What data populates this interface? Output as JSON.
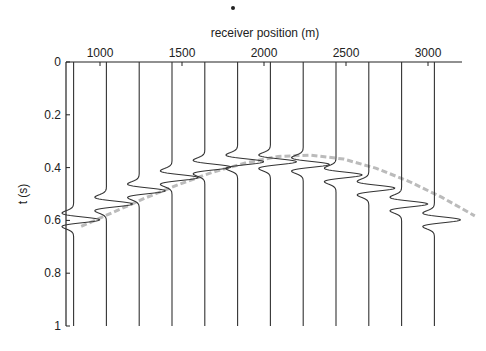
{
  "chart_data": {
    "type": "line",
    "subtype": "seismic-wiggle-traces",
    "title": "",
    "xlabel": "receiver position (m)",
    "ylabel": "t (s)",
    "x_axis_position": "top",
    "xlim": [
      800,
      3200
    ],
    "ylim": [
      0,
      1
    ],
    "y_inverted": true,
    "xticks": [
      1000,
      1500,
      2000,
      2500,
      3000
    ],
    "xtick_labels": [
      "1000",
      "1500",
      "2000",
      "2500",
      "3000"
    ],
    "yticks": [
      0,
      0.2,
      0.4,
      0.6,
      0.8,
      1
    ],
    "ytick_labels": [
      "0",
      "0.2",
      "0.4",
      "0.6",
      "0.8",
      "1"
    ],
    "grid": false,
    "series": [
      {
        "name": "traces",
        "receiver_positions": [
          900,
          1100,
          1300,
          1500,
          1700,
          1900,
          2100,
          2300,
          2500,
          2700,
          2900,
          3100
        ],
        "arrival_times": [
          0.56,
          0.5,
          0.45,
          0.4,
          0.36,
          0.34,
          0.34,
          0.35,
          0.39,
          0.44,
          0.5,
          0.56
        ]
      },
      {
        "name": "traveltime-curve",
        "style": "gray dashed hyperbola overlay",
        "x": [
          800,
          1000,
          1200,
          1400,
          1600,
          1800,
          2000,
          2200,
          2400,
          2600,
          2800,
          3000,
          3200
        ],
        "t": [
          0.6,
          0.545,
          0.49,
          0.44,
          0.395,
          0.36,
          0.335,
          0.33,
          0.345,
          0.38,
          0.43,
          0.49,
          0.56
        ]
      }
    ]
  },
  "labels": {
    "xlabel": "receiver position (m)",
    "ylabel": "t (s)",
    "xticks": [
      "1000",
      "1500",
      "2000",
      "2500",
      "3000"
    ],
    "yticks": [
      "0",
      "0.2",
      "0.4",
      "0.6",
      "0.8",
      "1"
    ]
  }
}
